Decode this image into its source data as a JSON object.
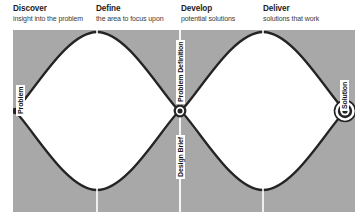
{
  "diagram": {
    "name": "Double Diamond design process",
    "colors": {
      "panel_background": "#a8a8a8",
      "diamond_fill": "#ffffff",
      "stroke": "#242424",
      "divider": "#ffffff",
      "title_text": "#1d1d1d",
      "subtitle_text": "#3a3a3a",
      "label_text": "#141414",
      "label_background": "#ffffff"
    },
    "phases": [
      {
        "title": "Discover",
        "subtitle": "insight into the problem"
      },
      {
        "title": "Define",
        "subtitle": "the area to focus upon"
      },
      {
        "title": "Develop",
        "subtitle": "potential solutions"
      },
      {
        "title": "Deliver",
        "subtitle": "solutions that work"
      }
    ],
    "nodes": [
      {
        "label": "Problem",
        "marker": "solid-dot"
      },
      {
        "label": "Problem Definition",
        "marker": "bullseye-small"
      },
      {
        "label": "Design Brief",
        "marker": "bullseye-small"
      },
      {
        "label": "Solution",
        "marker": "bullseye-large"
      }
    ]
  }
}
